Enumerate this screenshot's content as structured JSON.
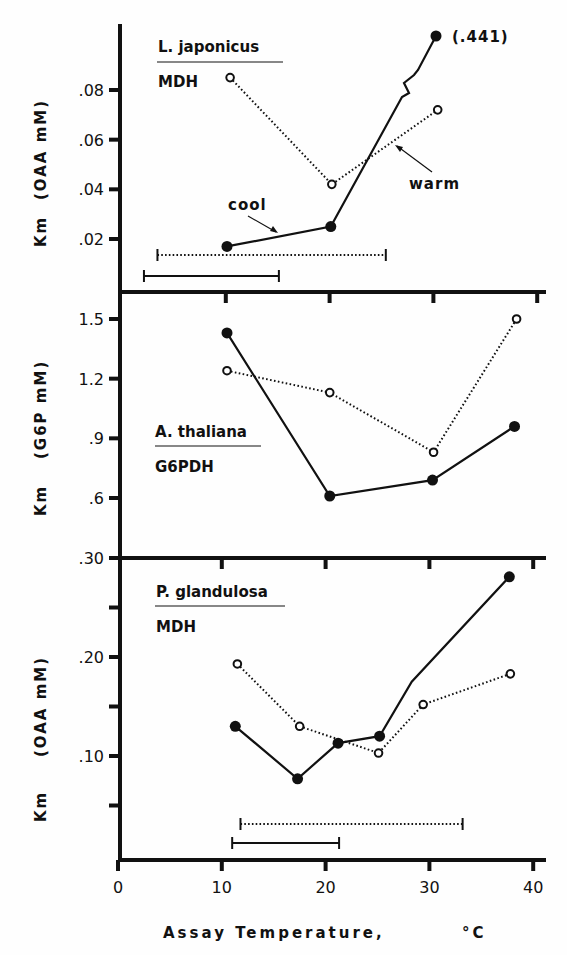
{
  "chart_data": [
    {
      "type": "line",
      "panel": "top",
      "species": "L. japonicus",
      "enzyme": "MDH",
      "ylabel": "Km    (OAA  mM)",
      "yticks": [
        ".02",
        ".04",
        ".06",
        ".08"
      ],
      "ytick_values": [
        0.02,
        0.04,
        0.06,
        0.08
      ],
      "ylim": [
        0.0,
        0.105
      ],
      "annotations": [
        {
          "text": "(.441)",
          "note": "off-scale value of cool point at 31°C, axis break shown"
        },
        {
          "text": "cool",
          "points_to": "cool"
        },
        {
          "text": "warm",
          "points_to": "warm"
        }
      ],
      "series": [
        {
          "name": "cool",
          "style": "solid",
          "marker": "filled-circle",
          "x": [
            10.5,
            20.5,
            30.8
          ],
          "y": [
            0.017,
            0.025,
            0.441
          ]
        },
        {
          "name": "warm",
          "style": "dotted",
          "marker": "open-circle",
          "x": [
            10.8,
            20.6,
            30.8
          ],
          "y": [
            0.085,
            0.042,
            0.072
          ]
        }
      ],
      "ranges": [
        {
          "series": "warm",
          "style": "dotted",
          "x": [
            3.8,
            25.8
          ]
        },
        {
          "series": "cool",
          "style": "solid",
          "x": [
            2.5,
            15.5
          ]
        }
      ]
    },
    {
      "type": "line",
      "panel": "middle",
      "species": "A. thaliana",
      "enzyme": "G6PDH",
      "ylabel": "Km    (G6P  mM)",
      "yticks": [
        ".6",
        ".9",
        "1.2",
        "1.5"
      ],
      "ytick_values": [
        0.6,
        0.9,
        1.2,
        1.5
      ],
      "ylim": [
        0.3,
        1.63
      ],
      "series": [
        {
          "name": "cool",
          "style": "solid",
          "marker": "filled-circle",
          "x": [
            10.5,
            20.4,
            30.3,
            38.2
          ],
          "y": [
            1.43,
            0.61,
            0.69,
            0.96
          ]
        },
        {
          "name": "warm",
          "style": "dotted",
          "marker": "open-circle",
          "x": [
            10.5,
            20.4,
            30.4,
            38.4
          ],
          "y": [
            1.24,
            1.13,
            0.83,
            1.5
          ]
        }
      ]
    },
    {
      "type": "line",
      "panel": "bottom",
      "species": "P. glandulosa",
      "enzyme": "MDH",
      "ylabel": "Km    (OAA  mM)",
      "yticks": [
        ".10",
        ".20",
        ".30"
      ],
      "ytick_values": [
        0.1,
        0.2,
        0.3
      ],
      "minor_ticks": [
        0.05,
        0.15,
        0.25
      ],
      "ylim": [
        0.0,
        0.3
      ],
      "xlabel": "Assay  Temperature,  °C",
      "xticks": [
        "0",
        "10",
        "20",
        "30",
        "40"
      ],
      "xtick_values": [
        0,
        10,
        20,
        30,
        40
      ],
      "xlim": [
        0,
        41
      ],
      "series": [
        {
          "name": "cool",
          "style": "solid",
          "marker": "filled-circle",
          "x": [
            11.3,
            17.3,
            21.2,
            25.2,
            37.7
          ],
          "y": [
            0.13,
            0.077,
            0.113,
            0.12,
            0.281
          ],
          "path_extra": {
            "x": 28.3,
            "y": 0.175
          }
        },
        {
          "name": "warm",
          "style": "dotted",
          "marker": "open-circle",
          "x": [
            11.5,
            17.5,
            25.1,
            29.4,
            37.8
          ],
          "y": [
            0.193,
            0.13,
            0.103,
            0.152,
            0.183
          ]
        }
      ],
      "ranges": [
        {
          "series": "warm",
          "style": "dotted",
          "x": [
            11.8,
            33.2
          ]
        },
        {
          "series": "cool",
          "style": "solid",
          "x": [
            11.0,
            21.3
          ]
        }
      ]
    }
  ],
  "figure": {
    "xlabel": "Assay  Temperature,",
    "xlabel_unit": "°C",
    "xticks": [
      "0",
      "10",
      "20",
      "30",
      "40"
    ],
    "ylabel_prefix": "Km",
    "panels": [
      {
        "species": "L. japonicus",
        "enzyme": "MDH",
        "units": "(OAA  mM)",
        "offscale_label": "(.441)",
        "cool_label": "cool",
        "warm_label": "warm"
      },
      {
        "species": "A. thaliana",
        "enzyme": "G6PDH",
        "units": "(G6P  mM)"
      },
      {
        "species": "P. glandulosa",
        "enzyme": "MDH",
        "units": "(OAA  mM)"
      }
    ]
  }
}
